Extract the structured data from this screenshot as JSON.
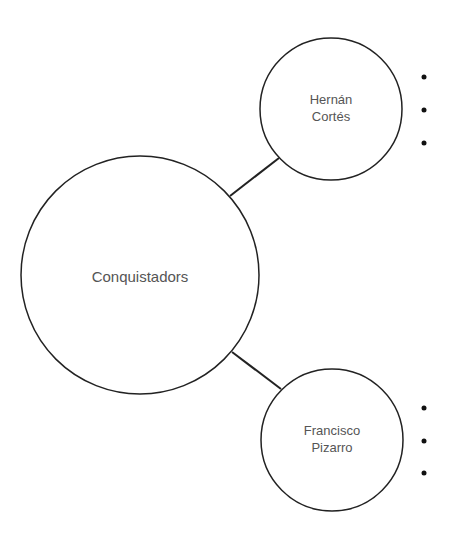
{
  "diagram": {
    "type": "mind-map",
    "center_node": {
      "label": "Conquistadors"
    },
    "child_nodes": [
      {
        "label_line1": "Hernán",
        "label_line2": "Cortés",
        "bullets": [
          "",
          "",
          ""
        ]
      },
      {
        "label_line1": "Francisco",
        "label_line2": "Pizarro",
        "bullets": [
          "",
          "",
          ""
        ]
      }
    ],
    "colors": {
      "stroke": "#222222",
      "text": "#555555",
      "background": "#ffffff"
    }
  }
}
